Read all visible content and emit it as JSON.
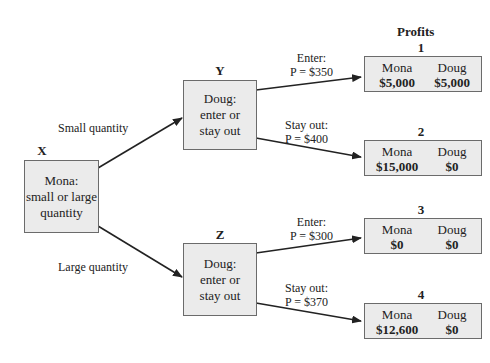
{
  "header": {
    "profits_title": "Profits"
  },
  "nodes": {
    "x": {
      "label": "X",
      "lines": [
        "Mona:",
        "small or large",
        "quantity"
      ]
    },
    "y": {
      "label": "Y",
      "lines": [
        "Doug:",
        "enter or",
        "stay out"
      ]
    },
    "z": {
      "label": "Z",
      "lines": [
        "Doug:",
        "enter or",
        "stay out"
      ]
    }
  },
  "edges": {
    "x_to_y": "Small quantity",
    "x_to_z": "Large quantity",
    "y_enter": {
      "line1": "Enter:",
      "line2": "P = $350"
    },
    "y_stay": {
      "line1": "Stay out:",
      "line2": "P = $400"
    },
    "z_enter": {
      "line1": "Enter:",
      "line2": "P = $300"
    },
    "z_stay": {
      "line1": "Stay out:",
      "line2": "P = $370"
    }
  },
  "outcomes": [
    {
      "number": "1",
      "player1": "Mona",
      "player2": "Doug",
      "p1_profit": "$5,000",
      "p2_profit": "$5,000"
    },
    {
      "number": "2",
      "player1": "Mona",
      "player2": "Doug",
      "p1_profit": "$15,000",
      "p2_profit": "$0"
    },
    {
      "number": "3",
      "player1": "Mona",
      "player2": "Doug",
      "p1_profit": "$0",
      "p2_profit": "$0"
    },
    {
      "number": "4",
      "player1": "Mona",
      "player2": "Doug",
      "p1_profit": "$12,600",
      "p2_profit": "$0"
    }
  ],
  "colors": {
    "box_fill": "#ebebeb",
    "box_border": "#6b6b6b",
    "line": "#222222"
  }
}
